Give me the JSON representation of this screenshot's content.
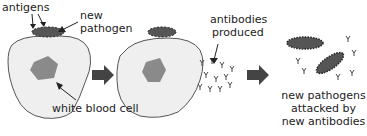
{
  "labels": {
    "antigens": "antigens",
    "new_pathogen_1": "new",
    "new_pathogen_2": "pathogen",
    "white_blood_cell": "white blood cell",
    "antibodies_1": "antibodies",
    "antibodies_2": "produced",
    "attacked_1": "new pathogens",
    "attacked_2": "attacked by",
    "attacked_3": "new antibodies"
  },
  "colors": {
    "cell_fill": "#efefef",
    "cell_stroke": "#555555",
    "nucleus": "#8a8a8a",
    "pathogen": "#555555",
    "arrow": "#444444"
  }
}
